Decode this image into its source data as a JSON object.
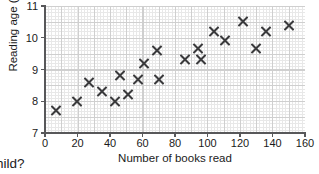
{
  "chart_data": {
    "type": "scatter",
    "title": "",
    "xlabel": "Number of books read",
    "ylabel": "Reading age (years)",
    "xlim": [
      0,
      160
    ],
    "ylim": [
      7,
      11
    ],
    "xticks": [
      0,
      20,
      40,
      60,
      80,
      100,
      120,
      140,
      160
    ],
    "yticks": [
      7,
      8,
      9,
      10,
      11
    ],
    "grid": true,
    "legend": "none",
    "marker": "x",
    "marker_color": "#3a3a3c",
    "points": [
      {
        "x": 7,
        "y": 7.7
      },
      {
        "x": 20,
        "y": 8.0
      },
      {
        "x": 27,
        "y": 8.6
      },
      {
        "x": 35,
        "y": 8.3
      },
      {
        "x": 43,
        "y": 8.0
      },
      {
        "x": 46,
        "y": 8.8
      },
      {
        "x": 51,
        "y": 8.2
      },
      {
        "x": 57,
        "y": 8.7
      },
      {
        "x": 61,
        "y": 9.2
      },
      {
        "x": 69,
        "y": 9.6
      },
      {
        "x": 70,
        "y": 8.7
      },
      {
        "x": 86,
        "y": 9.3
      },
      {
        "x": 94,
        "y": 9.65
      },
      {
        "x": 96,
        "y": 9.3
      },
      {
        "x": 104,
        "y": 10.2
      },
      {
        "x": 111,
        "y": 9.9
      },
      {
        "x": 122,
        "y": 10.5
      },
      {
        "x": 130,
        "y": 9.65
      },
      {
        "x": 136,
        "y": 10.2
      },
      {
        "x": 150,
        "y": 10.4
      }
    ]
  },
  "caption": {
    "fragment": "hild?"
  }
}
